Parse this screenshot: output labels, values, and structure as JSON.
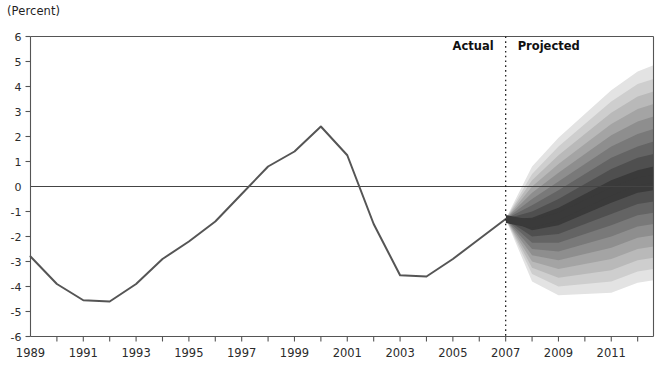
{
  "unit_label": "(Percent)",
  "annotations": {
    "actual": "Actual",
    "projected": "Projected",
    "divider_year": 2007
  },
  "chart_data": {
    "type": "line",
    "title": "",
    "subtitle": "",
    "xlabel": "",
    "ylabel": "(Percent)",
    "xlim": [
      1989,
      2012.6
    ],
    "ylim": [
      -6,
      6
    ],
    "ytick_step": 1,
    "yticks": [
      6,
      5,
      4,
      3,
      2,
      1,
      0,
      -1,
      -2,
      -3,
      -4,
      -5,
      -6
    ],
    "ytick_labels": [
      "6",
      "5",
      "4",
      "3",
      "2",
      "1",
      "0",
      "-1",
      "-2",
      "-3",
      "-4",
      "-5",
      "-6"
    ],
    "xticks": [
      1989,
      1990,
      1991,
      1992,
      1993,
      1994,
      1995,
      1996,
      1997,
      1998,
      1999,
      2000,
      2001,
      2002,
      2003,
      2004,
      2005,
      2006,
      2007,
      2008,
      2009,
      2010,
      2011,
      2012
    ],
    "xtick_labels_shown": [
      "1989",
      "1991",
      "1993",
      "1995",
      "1997",
      "1999",
      "2001",
      "2003",
      "2005",
      "2007",
      "2009",
      "2011"
    ],
    "xtick_label_years": [
      1989,
      1991,
      1993,
      1995,
      1997,
      1999,
      2001,
      2003,
      2005,
      2007,
      2009,
      2011
    ],
    "grid": false,
    "zero_line": true,
    "legend": "none",
    "colors": {
      "line": "#555555",
      "axis": "#555555",
      "zero_line": "#444444",
      "fan_dark": "#3a3a3a",
      "text": "#2b2b2b",
      "background": "#ffffff"
    },
    "series": [
      {
        "name": "Actual",
        "type": "line",
        "x": [
          1989,
          1990,
          1991,
          1992,
          1993,
          1994,
          1995,
          1996,
          1997,
          1998,
          1999,
          2000,
          2001,
          2002,
          2003,
          2004,
          2005,
          2006,
          2007
        ],
        "values": [
          -2.8,
          -3.9,
          -4.55,
          -4.6,
          -3.9,
          -2.9,
          -2.2,
          -1.4,
          -0.3,
          0.8,
          1.4,
          2.4,
          1.25,
          -1.5,
          -3.55,
          -3.6,
          -2.9,
          -2.1,
          -1.3
        ]
      }
    ],
    "fan": {
      "name": "Projected",
      "description": "Probability fan of projections, shading darkest at the central projection and lightest at the outer percentiles",
      "x": [
        2007,
        2008,
        2009,
        2010,
        2011,
        2012,
        2012.6
      ],
      "central": [
        -1.3,
        -1.5,
        -1.2,
        -0.7,
        -0.2,
        0.2,
        0.3
      ],
      "bands": [
        {
          "level": "10%",
          "lower": [
            -1.3,
            -1.75,
            -1.55,
            -1.1,
            -0.65,
            -0.25,
            -0.15
          ],
          "upper": [
            -1.3,
            -1.25,
            -0.85,
            -0.3,
            0.25,
            0.65,
            0.8
          ]
        },
        {
          "level": "20%",
          "lower": [
            -1.3,
            -2.0,
            -1.9,
            -1.5,
            -1.1,
            -0.7,
            -0.6
          ],
          "upper": [
            -1.3,
            -1.0,
            -0.5,
            0.1,
            0.7,
            1.15,
            1.3
          ]
        },
        {
          "level": "30%",
          "lower": [
            -1.3,
            -2.25,
            -2.25,
            -1.9,
            -1.55,
            -1.15,
            -1.05
          ],
          "upper": [
            -1.3,
            -0.75,
            -0.15,
            0.5,
            1.15,
            1.6,
            1.8
          ]
        },
        {
          "level": "40%",
          "lower": [
            -1.3,
            -2.5,
            -2.6,
            -2.3,
            -2.0,
            -1.6,
            -1.5
          ],
          "upper": [
            -1.3,
            -0.5,
            0.2,
            0.9,
            1.6,
            2.1,
            2.3
          ]
        },
        {
          "level": "50%",
          "lower": [
            -1.3,
            -2.75,
            -2.95,
            -2.7,
            -2.45,
            -2.05,
            -1.95
          ],
          "upper": [
            -1.3,
            -0.25,
            0.55,
            1.3,
            2.05,
            2.6,
            2.8
          ]
        },
        {
          "level": "60%",
          "lower": [
            -1.3,
            -3.0,
            -3.3,
            -3.1,
            -2.9,
            -2.5,
            -2.4
          ],
          "upper": [
            -1.3,
            0.0,
            0.9,
            1.7,
            2.5,
            3.1,
            3.3
          ]
        },
        {
          "level": "70%",
          "lower": [
            -1.3,
            -3.25,
            -3.65,
            -3.5,
            -3.35,
            -2.95,
            -2.85
          ],
          "upper": [
            -1.3,
            0.25,
            1.25,
            2.1,
            2.95,
            3.6,
            3.8
          ]
        },
        {
          "level": "80%",
          "lower": [
            -1.3,
            -3.5,
            -4.0,
            -3.9,
            -3.8,
            -3.4,
            -3.3
          ],
          "upper": [
            -1.3,
            0.5,
            1.6,
            2.5,
            3.4,
            4.1,
            4.3
          ]
        },
        {
          "level": "90%",
          "lower": [
            -1.3,
            -3.8,
            -4.35,
            -4.3,
            -4.25,
            -3.85,
            -3.75
          ],
          "upper": [
            -1.3,
            0.8,
            1.95,
            2.9,
            3.85,
            4.6,
            4.85
          ]
        }
      ]
    }
  }
}
